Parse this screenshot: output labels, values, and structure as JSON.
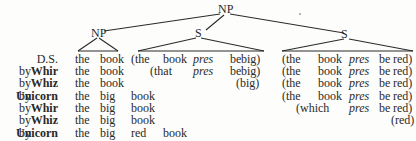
{
  "tree": {
    "root": "NP",
    "left_np": "NP",
    "mid_s": "S",
    "right_s": "S"
  },
  "rows": [
    {
      "by": "",
      "rule": "D.S.",
      "bold": false,
      "cells": [
        "the",
        "book",
        "(the",
        "book",
        "pres",
        "be",
        "big)",
        "(the",
        "book",
        "pres",
        "be",
        "red)"
      ]
    },
    {
      "by": "by",
      "rule": "Whir",
      "bold": true,
      "cells": [
        "the",
        "book",
        "",
        "(that",
        "pres",
        "be",
        "big)",
        "(the",
        "book",
        "pres",
        "be",
        "red)"
      ]
    },
    {
      "by": "by",
      "rule": "Whiz",
      "bold": true,
      "cells": [
        "the",
        "book",
        "",
        "",
        "",
        "",
        "(big)",
        "(the",
        "book",
        "pres",
        "be",
        "red)"
      ]
    },
    {
      "by": "by",
      "rule": "Unicorn",
      "bold": true,
      "cells": [
        "the",
        "big",
        "book",
        "",
        "",
        "",
        "",
        "(the",
        "book",
        "pres",
        "be",
        "red)"
      ]
    },
    {
      "by": "by",
      "rule": "Whir",
      "bold": true,
      "cells": [
        "the",
        "big",
        "book",
        "",
        "",
        "",
        "",
        "",
        "(which",
        "pres",
        "be",
        "red)"
      ]
    },
    {
      "by": "by",
      "rule": "Whiz",
      "bold": true,
      "cells": [
        "the",
        "big",
        "book",
        "",
        "",
        "",
        "",
        "",
        "",
        "",
        "",
        "(red)"
      ]
    },
    {
      "by": "by",
      "rule": "Unicorn",
      "bold": true,
      "cells": [
        "the",
        "big",
        "red",
        "book",
        "",
        "",
        "",
        "",
        "",
        "",
        "",
        ""
      ]
    }
  ]
}
